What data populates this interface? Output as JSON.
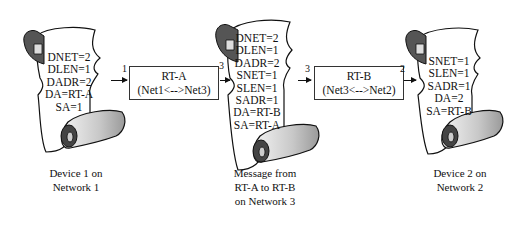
{
  "scrolls": [
    {
      "id": "device1",
      "lines": [
        "DNET=2",
        "DLEN=1",
        "DADR=2",
        "DA=RT-A",
        "SA=1"
      ],
      "caption": [
        "Device 1 on",
        "Network 1"
      ]
    },
    {
      "id": "message",
      "lines": [
        "DNET=2",
        "DLEN=1",
        "DADR=2",
        "SNET=1",
        "SLEN=1",
        "SADR=1",
        "DA=RT-B",
        "SA=RT-A"
      ],
      "caption": [
        "Message from",
        "RT-A to RT-B",
        "on Network 3"
      ]
    },
    {
      "id": "device2",
      "lines": [
        "SNET=1",
        "SLEN=1",
        "SADR=1",
        "DA=2",
        "SA=RT-B"
      ],
      "caption": [
        "Device 2 on",
        "Network 2"
      ]
    }
  ],
  "routers": [
    {
      "name": "RT-A",
      "link": "(Net1<-->Net3)"
    },
    {
      "name": "RT-B",
      "link": "(Net3<-->Net2)"
    }
  ],
  "hops": [
    {
      "label": "1"
    },
    {
      "label": "3"
    },
    {
      "label": "3"
    },
    {
      "label": "2"
    }
  ]
}
